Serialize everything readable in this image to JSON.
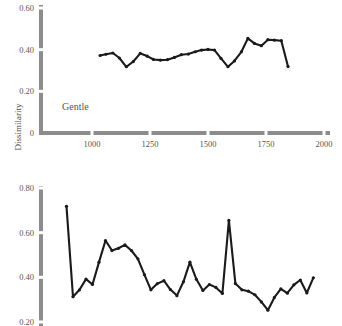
{
  "figure": {
    "y_axis_title": "Dissimilarity",
    "panels": [
      {
        "name": "top-panel",
        "label": "Gentle",
        "chart_data": {
          "type": "line",
          "title": "Gentle",
          "xlabel": "",
          "ylabel": "Dissimilarity",
          "xlim": [
            800,
            2000
          ],
          "ylim": [
            0,
            0.65
          ],
          "xticks": [
            1000,
            1250,
            1500,
            1750,
            2000
          ],
          "xticklabels": [
            "1000",
            "1250",
            "1500",
            "1750",
            "2000"
          ],
          "yticks": [
            0,
            0.2,
            0.4,
            0.6
          ],
          "yticklabels": [
            "0",
            "0.20",
            "0.40",
            "0.60"
          ],
          "grid": false,
          "legend": "none",
          "markers": true,
          "x": [
            1035,
            1060,
            1090,
            1118,
            1148,
            1178,
            1208,
            1238,
            1265,
            1295,
            1325,
            1355,
            1385,
            1415,
            1445,
            1472,
            1500,
            1528,
            1556,
            1586,
            1614,
            1644,
            1672,
            1700,
            1730,
            1758,
            1786,
            1816,
            1845
          ],
          "values": [
            0.372,
            0.378,
            0.384,
            0.36,
            0.318,
            0.343,
            0.382,
            0.369,
            0.353,
            0.35,
            0.352,
            0.363,
            0.376,
            0.379,
            0.39,
            0.398,
            0.401,
            0.398,
            0.358,
            0.318,
            0.346,
            0.39,
            0.454,
            0.43,
            0.419,
            0.448,
            0.446,
            0.443,
            0.319
          ]
        }
      },
      {
        "name": "bottom-panel",
        "label": "",
        "chart_data": {
          "type": "line",
          "title": "",
          "xlabel": "",
          "ylabel": "Dissimilarity",
          "xlim": [
            800,
            2000
          ],
          "ylim": [
            0.2,
            0.84
          ],
          "xticks": [],
          "xticklabels": [],
          "yticks": [
            0.2,
            0.4,
            0.6,
            0.8
          ],
          "yticklabels": [
            "0.20",
            "0.40",
            "0.60",
            "0.80"
          ],
          "grid": false,
          "legend": "none",
          "markers": true,
          "x": [
            890,
            918,
            946,
            974,
            1002,
            1030,
            1058,
            1086,
            1114,
            1142,
            1170,
            1198,
            1226,
            1254,
            1282,
            1310,
            1338,
            1366,
            1394,
            1422,
            1450,
            1478,
            1506,
            1534,
            1562,
            1590,
            1618,
            1646,
            1674,
            1702,
            1730,
            1758,
            1786,
            1814,
            1842,
            1870,
            1898,
            1926,
            1954
          ],
          "values": [
            0.718,
            0.313,
            0.344,
            0.392,
            0.368,
            0.468,
            0.565,
            0.52,
            0.53,
            0.545,
            0.52,
            0.483,
            0.412,
            0.344,
            0.372,
            0.385,
            0.345,
            0.318,
            0.38,
            0.468,
            0.391,
            0.341,
            0.368,
            0.355,
            0.328,
            0.655,
            0.372,
            0.344,
            0.338,
            0.322,
            0.29,
            0.253,
            0.31,
            0.348,
            0.329,
            0.366,
            0.388,
            0.33,
            0.398
          ]
        }
      }
    ]
  }
}
